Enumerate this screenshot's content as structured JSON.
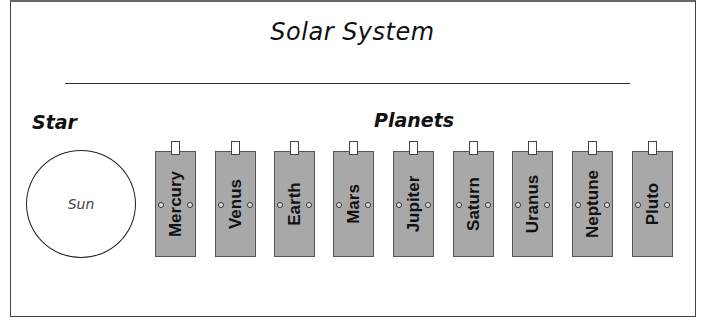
{
  "title": "Solar System",
  "star_section": {
    "heading": "Star",
    "star": "Sun"
  },
  "planets_section": {
    "heading": "Planets",
    "planets": [
      "Mercury",
      "Venus",
      "Earth",
      "Mars",
      "Jupiter",
      "Saturn",
      "Uranus",
      "Neptune",
      "Pluto"
    ]
  },
  "colors": {
    "card_fill": "#a8a8a8",
    "border": "#444444"
  }
}
